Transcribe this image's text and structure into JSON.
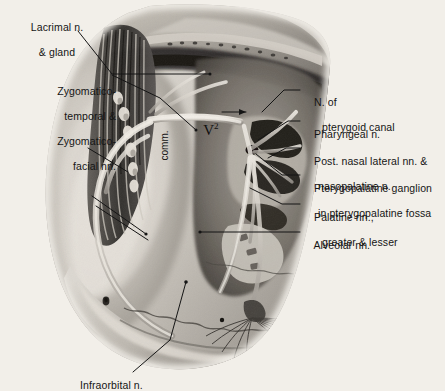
{
  "figure": {
    "background_color": "#f2efe9",
    "ink_color": "#151515",
    "leader_color": "#1a1a1a"
  },
  "labels": {
    "lacrimal": {
      "line1": "Lacrimal n.",
      "line2": "& gland"
    },
    "zygomatic": {
      "line1": "Zygomatico-",
      "line2": "temporal &",
      "line3": "Zygomatico-",
      "line4": "facial nn."
    },
    "pterygoid_canal": {
      "line1": "N. of",
      "line2": "pterygoid canal"
    },
    "pharyngeal": {
      "line1": "Pharyngeal n."
    },
    "post_nasal": {
      "line1": "Post. nasal lateral nn. &",
      "line2": "nasopalatine n."
    },
    "ganglion": {
      "line1": "Pterygopalatine ganglion",
      "line2": "in pterygopalatine fossa"
    },
    "palatine": {
      "line1": "Palatine nn.,",
      "line2": "greater & lesser"
    },
    "alveolar": {
      "line1": "Alveolar nn."
    },
    "infraorbital": {
      "line1": "Infraorbital n."
    },
    "comm": {
      "text": "comm."
    },
    "v2": {
      "text": "V",
      "superscript": "2"
    }
  }
}
